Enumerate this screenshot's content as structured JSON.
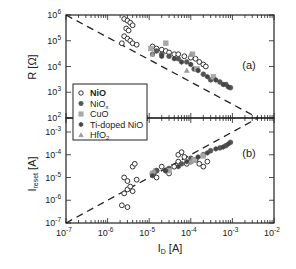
{
  "chart_data": [
    {
      "panel": "a",
      "type": "scatter",
      "title": "",
      "panel_label": "(a)",
      "xlabel": "I_D [A]",
      "ylabel": "R [Ω]",
      "xscale": "log",
      "yscale": "log",
      "xlim": [
        1e-07,
        0.01
      ],
      "ylim": [
        100.0,
        1000000.0
      ],
      "yticks": [
        "10^2",
        "10^3",
        "10^4",
        "10^5",
        "10^6"
      ],
      "guide_line": {
        "style": "dashed",
        "description": "R ∝ 1/I_D",
        "from": [
          1e-07,
          4000000.0
        ],
        "to": [
          0.004,
          100.0
        ]
      },
      "series": [
        {
          "name": "NiO",
          "marker": "open-circle",
          "points": [
            [
              2.5e-06,
              700000.0
            ],
            [
              3e-06,
              600000.0
            ],
            [
              3.5e-06,
              500000.0
            ],
            [
              4e-06,
              400000.0
            ],
            [
              2.8e-06,
              300000.0
            ],
            [
              3.2e-06,
              250000.0
            ],
            [
              2.5e-06,
              150000.0
            ],
            [
              3e-06,
              120000.0
            ],
            [
              3.5e-06,
              100000.0
            ],
            [
              4e-06,
              80000.0
            ],
            [
              2.2e-06,
              80000.0
            ],
            [
              5e-06,
              70000.0
            ],
            [
              1.2e-05,
              60000.0
            ],
            [
              1.5e-05,
              50000.0
            ],
            [
              2e-05,
              45000.0
            ],
            [
              2.5e-05,
              40000.0
            ],
            [
              3e-05,
              35000.0
            ],
            [
              4e-05,
              30000.0
            ],
            [
              5e-05,
              30000.0
            ],
            [
              7e-05,
              25000.0
            ],
            [
              0.0001,
              22000.0
            ],
            [
              0.00013,
              20000.0
            ],
            [
              0.00016,
              15000.0
            ],
            [
              0.0002,
              12000.0
            ],
            [
              0.00023,
              10000.0
            ]
          ]
        },
        {
          "name": "NiOx",
          "marker": "filled-circle",
          "points": [
            [
              1.5e-05,
              40000.0
            ],
            [
              2e-05,
              30000.0
            ],
            [
              3e-05,
              25000.0
            ],
            [
              5e-05,
              20000.0
            ],
            [
              8e-05,
              15000.0
            ],
            [
              0.00012,
              8000.0
            ],
            [
              0.0002,
              5000.0
            ],
            [
              0.0003,
              3000.0
            ],
            [
              0.0005,
              2500.0
            ],
            [
              0.0007,
              2000.0
            ],
            [
              0.0009,
              1500.0
            ]
          ]
        },
        {
          "name": "CuO",
          "marker": "filled-square",
          "points": [
            [
              1.1e-05,
              50000.0
            ],
            [
              2.5e-05,
              80000.0
            ],
            [
              0.00011,
              30000.0
            ],
            [
              0.00014,
              8000.0
            ],
            [
              0.00035,
              4000.0
            ]
          ]
        },
        {
          "name": "Ti-doped NiO",
          "marker": "filled-hexagon",
          "points": [
            [
              1.2e-05,
              30000.0
            ],
            [
              2e-05,
              25000.0
            ],
            [
              4e-05,
              20000.0
            ],
            [
              6e-05,
              15000.0
            ],
            [
              0.0001,
              12000.0
            ],
            [
              0.00015,
              7000.0
            ],
            [
              0.00025,
              4000.0
            ],
            [
              0.0004,
              3000.0
            ],
            [
              0.0006,
              2000.0
            ],
            [
              0.0008,
              1600.0
            ]
          ]
        },
        {
          "name": "HfO2",
          "marker": "filled-triangle",
          "points": [
            [
              1.2e-05,
              30000.0
            ],
            [
              8e-05,
              7000.0
            ],
            [
              0.0001,
              30000.0
            ]
          ]
        }
      ]
    },
    {
      "panel": "b",
      "type": "scatter",
      "panel_label": "(b)",
      "xlabel": "I_D [A]",
      "ylabel": "I_reset [A]",
      "xscale": "log",
      "yscale": "log",
      "xlim": [
        1e-07,
        0.01
      ],
      "ylim": [
        1e-07,
        0.001
      ],
      "xticks": [
        "10^-7",
        "10^-6",
        "10^-5",
        "10^-4",
        "10^-3",
        "10^-2"
      ],
      "yticks": [
        "10^-7",
        "10^-6",
        "10^-5",
        "10^-4",
        "10^-3"
      ],
      "guide_line": {
        "style": "dashed",
        "description": "I_reset = I_D",
        "from": [
          1e-07,
          1e-07
        ],
        "to": [
          0.004,
          0.004
        ]
      },
      "series": [
        {
          "name": "NiO",
          "marker": "open-circle",
          "points": [
            [
              2.2e-06,
              6e-07
            ],
            [
              3e-06,
              5e-07
            ],
            [
              2.5e-06,
              2e-06
            ],
            [
              3e-06,
              3e-06
            ],
            [
              3.5e-06,
              4e-06
            ],
            [
              4e-06,
              2.5e-06
            ],
            [
              2.5e-06,
              1e-05
            ],
            [
              3e-06,
              7e-06
            ],
            [
              4e-06,
              3e-05
            ],
            [
              4.5e-06,
              4e-05
            ],
            [
              5e-06,
              8e-06
            ],
            [
              1.2e-05,
              1.5e-05
            ],
            [
              1.5e-05,
              2e-05
            ],
            [
              2e-05,
              3e-05
            ],
            [
              1.5e-05,
              1e-05
            ],
            [
              2.5e-05,
              2e-05
            ],
            [
              3e-05,
              1.5e-05
            ],
            [
              4e-05,
              3e-05
            ],
            [
              5e-05,
              5e-05
            ],
            [
              7e-05,
              8e-05
            ],
            [
              8e-05,
              4e-05
            ],
            [
              0.0001,
              5e-05
            ],
            [
              0.00013,
              6e-05
            ],
            [
              0.00016,
              4e-05
            ],
            [
              0.0002,
              3e-05
            ],
            [
              0.00025,
              5e-05
            ],
            [
              5e-05,
              0.0001
            ],
            [
              6e-05,
              0.00013
            ]
          ]
        },
        {
          "name": "NiOx",
          "marker": "filled-circle",
          "points": [
            [
              1.5e-05,
              2e-05
            ],
            [
              3e-05,
              2.5e-05
            ],
            [
              6e-05,
              4e-05
            ],
            [
              0.0001,
              7e-05
            ],
            [
              0.0002,
              0.0001
            ],
            [
              0.0003,
              0.00015
            ],
            [
              0.0005,
              0.0002
            ],
            [
              0.0007,
              0.00025
            ],
            [
              0.0009,
              0.00035
            ]
          ]
        },
        {
          "name": "CuO",
          "marker": "filled-square",
          "points": [
            [
              1.2e-05,
              1.5e-05
            ],
            [
              3e-05,
              2e-05
            ],
            [
              0.00012,
              6e-05
            ],
            [
              0.0002,
              9e-05
            ]
          ]
        },
        {
          "name": "Ti-doped NiO",
          "marker": "filled-hexagon",
          "points": [
            [
              1.2e-05,
              1.2e-05
            ],
            [
              2.5e-05,
              2e-05
            ],
            [
              5e-05,
              3e-05
            ],
            [
              8e-05,
              5e-05
            ],
            [
              0.00015,
              8e-05
            ],
            [
              0.00025,
              0.00012
            ],
            [
              0.0004,
              0.00018
            ],
            [
              0.0006,
              0.00022
            ],
            [
              0.0008,
              0.0003
            ]
          ]
        },
        {
          "name": "HfO2",
          "marker": "filled-triangle",
          "points": [
            [
              1.3e-05,
              2e-05
            ],
            [
              0.0001,
              5e-05
            ]
          ]
        }
      ]
    }
  ],
  "labels": {
    "panel_a": "(a)",
    "panel_b": "(b)",
    "ylabel_top": "R [Ω]",
    "ylabel_bottom_main": "I",
    "ylabel_bottom_sub": "reset",
    "ylabel_bottom_unit": " [A]",
    "xlabel_main": "I",
    "xlabel_sub": "D",
    "xlabel_unit": " [A]",
    "yticks_top": [
      "6",
      "5",
      "4",
      "3",
      "2"
    ],
    "yticks_bottom": [
      "-3",
      "-4",
      "-5",
      "-6",
      "-7"
    ],
    "xticks": [
      "-7",
      "-6",
      "-5",
      "-4",
      "-3",
      "-2"
    ],
    "tick_base": "10"
  },
  "legend": {
    "items": [
      {
        "label": "NiO",
        "bold": true,
        "marker": "open-circle"
      },
      {
        "label": "NiO",
        "sub": "x",
        "marker": "filled-circle"
      },
      {
        "label": "CuO",
        "marker": "filled-square"
      },
      {
        "label": "Ti-doped NiO",
        "marker": "filled-hexagon"
      },
      {
        "label": "HfO",
        "sub": "2",
        "marker": "filled-triangle"
      }
    ]
  },
  "colors": {
    "frame": "#222222",
    "nio": "#333333",
    "niox": "#555555",
    "cuo": "#a8a8a8",
    "ti_nio": "#444444",
    "hfo2": "#9a9a9a"
  }
}
